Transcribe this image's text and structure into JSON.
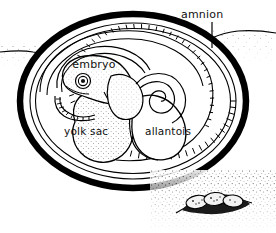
{
  "figure": {
    "background_color": "#ffffff",
    "ink_color": "#000000",
    "width": 276,
    "height": 233
  },
  "labels": {
    "amnion": "amnion",
    "embryo": "embryo",
    "yolk_sac": "yolk sac",
    "allantois": "allantois"
  },
  "structures": {
    "shell": "egg-shell",
    "chorion": "chorion-membrane",
    "amnion_cavity": "amniotic-cavity",
    "embryo_body": "embryo-body",
    "embryo_eye": "embryo-eye",
    "yolk_sac_body": "yolk-sac",
    "allantois_body": "allantois",
    "nest": "nest-of-eggs",
    "ground": "ground-line"
  },
  "nest": {
    "egg_count": 3
  }
}
